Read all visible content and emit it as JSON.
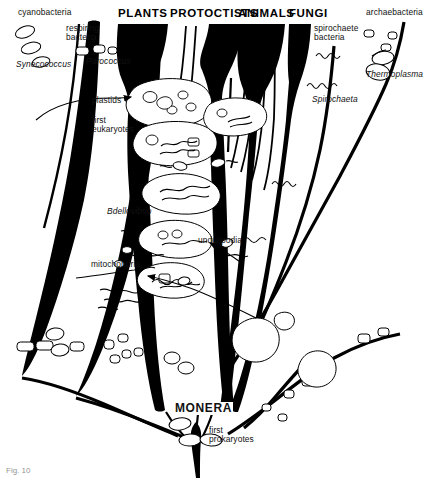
{
  "figure": {
    "caption": "Fig. 10",
    "background_color": "#ffffff",
    "ink_color": "#000000"
  },
  "kingdom_labels": [
    {
      "id": "plants",
      "text": "PLANTS",
      "x": 118,
      "y": 8
    },
    {
      "id": "protoctists",
      "text": "PROTOCTISTS",
      "x": 172,
      "y": 8
    },
    {
      "id": "animals",
      "text": "ANIMALS",
      "x": 239,
      "y": 8
    },
    {
      "id": "fungi",
      "text": "FUNGI",
      "x": 289,
      "y": 8
    },
    {
      "id": "monera",
      "text": "MONERA",
      "x": 176,
      "y": 406
    }
  ],
  "group_labels": [
    {
      "id": "cyanobacteria",
      "text": "cyanobacteria",
      "x": 20,
      "y": 10
    },
    {
      "id": "respiring-bacteria",
      "text": "respiring\nbacteria",
      "x": 66,
      "y": 26
    },
    {
      "id": "spirochaete-bacteria",
      "text": "spirochaete\nbacteria",
      "x": 315,
      "y": 26
    },
    {
      "id": "archaebacteria",
      "text": "archaebacteria",
      "x": 372,
      "y": 10
    }
  ],
  "genus_labels": [
    {
      "id": "synecococcus",
      "text": "Synecococcus",
      "x": 16,
      "y": 57
    },
    {
      "id": "parococcus",
      "text": "Parococcus",
      "x": 88,
      "y": 56
    },
    {
      "id": "thermoplasma",
      "text": "Thermoplasma",
      "x": 370,
      "y": 68
    },
    {
      "id": "spirochaeta",
      "text": "Spirochaeta",
      "x": 314,
      "y": 96
    },
    {
      "id": "bdellovibrio",
      "text": "Bdellovibrio",
      "x": 108,
      "y": 207
    }
  ],
  "annotation_labels": [
    {
      "id": "plastids",
      "text": "plastids",
      "x": 93,
      "y": 97
    },
    {
      "id": "first-eukaryotes",
      "text": "first\neukaryotes",
      "x": 93,
      "y": 118
    },
    {
      "id": "mitochondria",
      "text": "mitochondria",
      "x": 93,
      "y": 261
    },
    {
      "id": "undulipodia",
      "text": "undulipodia",
      "x": 199,
      "y": 237
    },
    {
      "id": "first-prokaryotes",
      "text": "first\nprokaryotes",
      "x": 210,
      "y": 427
    }
  ],
  "legend_notes": {
    "diagram_type": "phylogenetic symbiogenesis tree",
    "root_label": "MONERA",
    "crown_labels": [
      "PLANTS",
      "PROTOCTISTS",
      "ANIMALS",
      "FUNGI"
    ]
  }
}
